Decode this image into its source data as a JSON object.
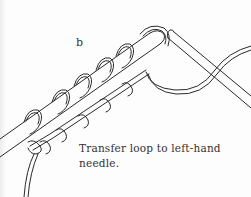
{
  "figure": {
    "step_label": "b",
    "caption_line1": "Transfer loop to left-hand",
    "caption_line2": "needle.",
    "colors": {
      "ink": "#2a2a2a",
      "paper": "#fdfdfd"
    }
  }
}
